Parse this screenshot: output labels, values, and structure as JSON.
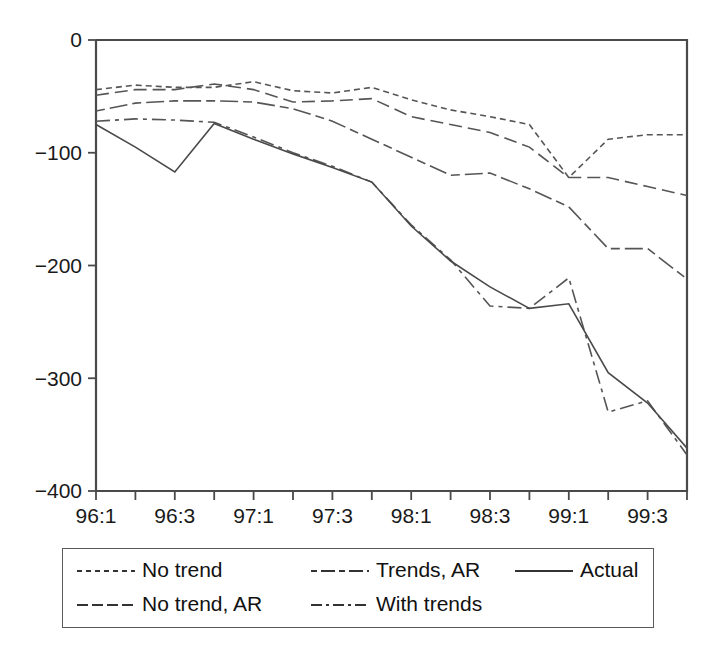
{
  "chart_data": {
    "type": "line",
    "title": "",
    "xlabel": "",
    "ylabel": "",
    "ylim": [
      -400,
      0
    ],
    "yticks": [
      0,
      -100,
      -200,
      -300,
      -400
    ],
    "ytick_labels": [
      "0",
      "−100",
      "−200",
      "−300",
      "−400"
    ],
    "x": [
      "96:1",
      "96:2",
      "96:3",
      "96:4",
      "97:1",
      "97:2",
      "97:3",
      "97:4",
      "98:1",
      "98:2",
      "98:3",
      "98:4",
      "99:1",
      "99:2",
      "99:3",
      "99:4"
    ],
    "xtick_labels": [
      "96:1",
      "",
      "96:3",
      "",
      "97:1",
      "",
      "97:3",
      "",
      "98:1",
      "",
      "98:3",
      "",
      "99:1",
      "",
      "99:3",
      ""
    ],
    "grid": false,
    "legend_position": "below-plot",
    "series": [
      {
        "name": "No trend",
        "style": "dotted",
        "values": [
          -44,
          -40,
          -42,
          -42,
          -37,
          -45,
          -47,
          -42,
          -53,
          -62,
          -68,
          -75,
          -122,
          -88,
          -84,
          -84
        ]
      },
      {
        "name": "No trend, AR",
        "style": "dashed",
        "values": [
          -49,
          -44,
          -44,
          -39,
          -44,
          -55,
          -54,
          -52,
          -68,
          -75,
          -82,
          -95,
          -122,
          -122,
          -130,
          -138
        ]
      },
      {
        "name": "Trends, AR",
        "style": "dash-dash-long",
        "values": [
          -63,
          -56,
          -54,
          -54,
          -55,
          -61,
          -72,
          -88,
          -104,
          -120,
          -118,
          -132,
          -148,
          -185,
          -185,
          -212
        ]
      },
      {
        "name": "With trends",
        "style": "dash-dot",
        "values": [
          -72,
          -70,
          -71,
          -73,
          -86,
          -100,
          -112,
          -126,
          -164,
          -195,
          -236,
          -238,
          -211,
          -330,
          -320,
          -368
        ]
      },
      {
        "name": "Actual",
        "style": "solid",
        "values": [
          -75,
          -95,
          -117,
          -74,
          -88,
          -101,
          -113,
          -126,
          -165,
          -196,
          -219,
          -238,
          -234,
          -295,
          -322,
          -362
        ]
      }
    ]
  },
  "legend": {
    "entries": [
      {
        "label": "No trend",
        "style": "dotted"
      },
      {
        "label": "Trends, AR",
        "style": "dash-dash-long"
      },
      {
        "label": "Actual",
        "style": "solid"
      },
      {
        "label": "No trend, AR",
        "style": "dashed"
      },
      {
        "label": "With trends",
        "style": "dash-dot"
      }
    ]
  },
  "colors": {
    "line": "#555555",
    "axis": "#4a4a4a",
    "text": "#1a1a1a",
    "background": "#ffffff"
  }
}
